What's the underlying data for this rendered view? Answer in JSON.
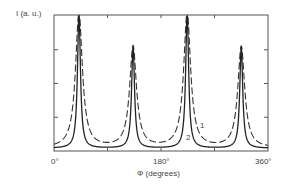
{
  "chart_data": {
    "type": "line",
    "title": "",
    "xlabel": "Φ  (degrees)",
    "ylabel": "I  (a. u.)",
    "xlim": [
      0,
      360
    ],
    "ylim": [
      0,
      1
    ],
    "x_ticks": [
      "0°",
      "180°",
      "360°"
    ],
    "grid": false,
    "legend": "inline curve labels",
    "series": [
      {
        "name": "1",
        "style": "dashed",
        "description": "broader peaks",
        "peaks": [
          {
            "x": 42,
            "y": 1.0
          },
          {
            "x": 133,
            "y": 0.75
          },
          {
            "x": 224,
            "y": 1.0
          },
          {
            "x": 315,
            "y": 0.75
          }
        ],
        "width": 14
      },
      {
        "name": "2",
        "style": "solid",
        "description": "narrow peaks",
        "peaks": [
          {
            "x": 42,
            "y": 1.0
          },
          {
            "x": 133,
            "y": 0.75
          },
          {
            "x": 224,
            "y": 1.0
          },
          {
            "x": 315,
            "y": 0.75
          }
        ],
        "width": 6
      }
    ],
    "annotations": [
      {
        "text": "1",
        "x": 235,
        "y": 0.35
      },
      {
        "text": "2",
        "x": 228,
        "y": 0.15
      }
    ]
  },
  "labels": {
    "ylabel": "I  (a. u.)",
    "xlabel": "Φ   (degrees)",
    "tick0": "0°",
    "tick180": "180°",
    "tick360": "360°",
    "curve1": "1",
    "curve2": "2"
  }
}
